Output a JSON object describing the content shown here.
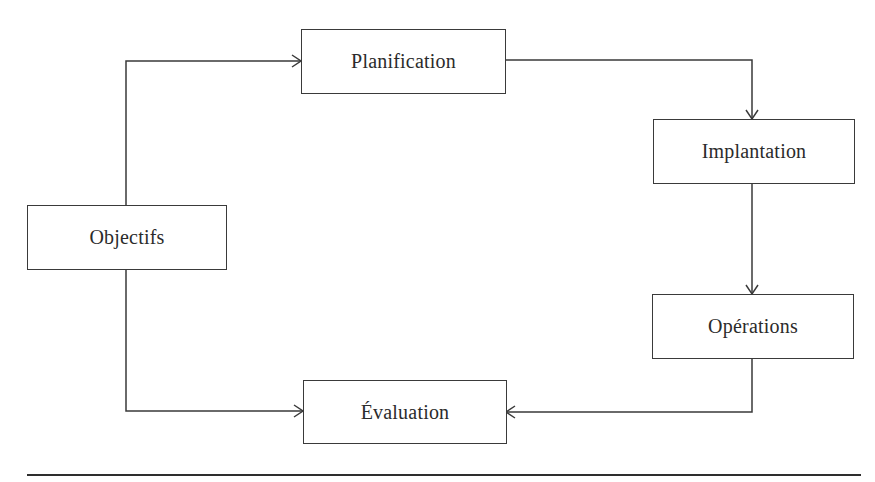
{
  "diagram": {
    "type": "cycle-flowchart",
    "line_color": "#3a3a3a",
    "text_color": "#2b2b2b",
    "nodes": [
      {
        "id": "objectifs",
        "label": "Objectifs"
      },
      {
        "id": "planification",
        "label": "Planification"
      },
      {
        "id": "implantation",
        "label": "Implantation"
      },
      {
        "id": "operations",
        "label": "Opérations"
      },
      {
        "id": "evaluation",
        "label": "Évaluation"
      }
    ],
    "edges": [
      {
        "from": "Objectifs",
        "to": "Planification"
      },
      {
        "from": "Planification",
        "to": "Implantation"
      },
      {
        "from": "Implantation",
        "to": "Opérations"
      },
      {
        "from": "Opérations",
        "to": "Évaluation"
      },
      {
        "from": "Objectifs",
        "to": "Évaluation"
      }
    ]
  }
}
